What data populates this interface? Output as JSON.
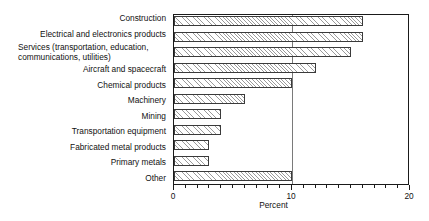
{
  "chart_data": {
    "type": "bar",
    "orientation": "horizontal",
    "title": "",
    "xlabel": "Percent",
    "ylabel": "",
    "xlim": [
      0,
      20
    ],
    "xticks": [
      0,
      10,
      20
    ],
    "xtick_labels": [
      "0",
      "10",
      "20"
    ],
    "minor_tick_interval": 1,
    "grid": "vertical gridline at x = 10",
    "legend": "none",
    "categories": [
      "Construction",
      "Electrical and electronics products",
      "Services (transportation, education, communications, utilities)",
      "Aircraft and spacecraft",
      "Chemical products",
      "Machinery",
      "Mining",
      "Transportation equipment",
      "Fabricated metal products",
      "Primary metals",
      "Other"
    ],
    "values": [
      16,
      16,
      15,
      12,
      10,
      6,
      4,
      4,
      3,
      3,
      10
    ],
    "bar_fill": "diagonal hatch",
    "bar_edge_color": "#3a3a3a",
    "bar_hatch_color": "#9a9a9a",
    "axis_color": "#1a1a1a",
    "gridline_color": "#7a7a7a",
    "background_color": "#ffffff"
  },
  "labels": {
    "services_line1": "Services (transportation, education,",
    "services_line2": "communications, utilities)"
  }
}
